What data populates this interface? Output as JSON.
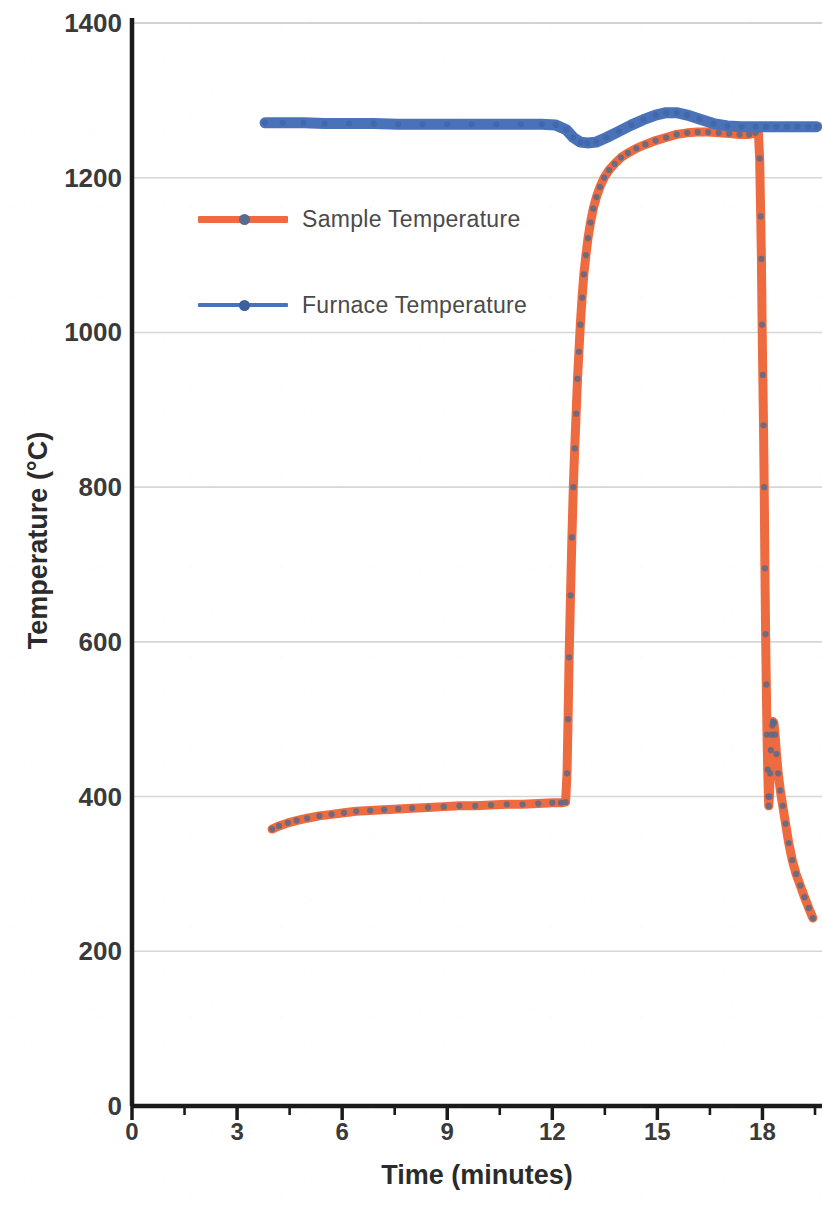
{
  "chart_data": {
    "type": "line",
    "title": "",
    "xlabel": "Time (minutes)",
    "ylabel": "Temperature (°C)",
    "xlim": [
      0,
      19.7
    ],
    "ylim": [
      0,
      1400
    ],
    "xticks": [
      0,
      3,
      6,
      9,
      12,
      15,
      18
    ],
    "xtick_labels": [
      "0",
      "3",
      "6",
      "9",
      "12",
      "15",
      "18"
    ],
    "x_minor_tick_interval": 1.5,
    "yticks": [
      0,
      200,
      400,
      600,
      800,
      1000,
      1200,
      1400
    ],
    "ytick_labels": [
      "0",
      "200",
      "400",
      "600",
      "800",
      "1000",
      "1200",
      "1400"
    ],
    "grid": "horizontal-only",
    "grid_color": "#c9c9c9",
    "legend_position": "upper-left-inside",
    "axis_color": "#1a1a1a",
    "series": [
      {
        "name": "Sample Temperature",
        "color": "#ED6B3F",
        "marker": "circle",
        "marker_color": "#5a6a8a",
        "x": [
          4.0,
          4.2,
          4.45,
          4.7,
          5.0,
          5.35,
          5.7,
          6.05,
          6.4,
          6.8,
          7.2,
          7.6,
          8.0,
          8.45,
          8.9,
          9.35,
          9.8,
          10.25,
          10.7,
          11.15,
          11.6,
          12.0,
          12.25,
          12.38,
          12.42,
          12.45,
          12.48,
          12.52,
          12.56,
          12.6,
          12.64,
          12.68,
          12.72,
          12.76,
          12.8,
          12.85,
          12.9,
          12.96,
          13.02,
          13.09,
          13.17,
          13.26,
          13.36,
          13.48,
          13.62,
          13.78,
          13.96,
          14.16,
          14.4,
          14.66,
          14.95,
          15.25,
          15.55,
          15.85,
          16.15,
          16.45,
          16.75,
          17.05,
          17.35,
          17.62,
          17.8,
          17.88,
          17.92,
          17.95,
          17.97,
          17.99,
          18.01,
          18.03,
          18.05,
          18.07,
          18.09,
          18.11,
          18.13,
          18.15,
          18.17,
          18.18,
          18.2,
          18.22,
          18.24,
          18.26,
          18.28,
          18.3,
          18.33,
          18.36,
          18.4,
          18.45,
          18.51,
          18.58,
          18.66,
          18.75,
          18.85,
          18.96,
          19.08,
          19.2,
          19.32,
          19.44
        ],
        "y": [
          358,
          362,
          366,
          369,
          372,
          375,
          377,
          379,
          381,
          382,
          383,
          384,
          385,
          386,
          387,
          388,
          388,
          389,
          390,
          390,
          391,
          392,
          392,
          393,
          430,
          500,
          580,
          660,
          735,
          800,
          850,
          895,
          940,
          975,
          1010,
          1045,
          1075,
          1100,
          1122,
          1142,
          1160,
          1175,
          1188,
          1200,
          1210,
          1218,
          1226,
          1232,
          1238,
          1243,
          1248,
          1252,
          1256,
          1258,
          1259,
          1259,
          1258,
          1257,
          1256,
          1256,
          1258,
          1262,
          1225,
          1150,
          1095,
          1010,
          945,
          880,
          800,
          695,
          610,
          545,
          480,
          435,
          400,
          388,
          400,
          430,
          460,
          480,
          492,
          497,
          495,
          480,
          455,
          430,
          408,
          388,
          365,
          340,
          318,
          300,
          285,
          270,
          256,
          243
        ]
      },
      {
        "name": "Furnace Temperature",
        "color": "#4A72B8",
        "marker": "circle",
        "marker_color": "#3d5f9e",
        "x": [
          3.8,
          4.3,
          4.9,
          5.5,
          6.2,
          6.9,
          7.6,
          8.3,
          9.0,
          9.7,
          10.4,
          11.1,
          11.7,
          12.1,
          12.4,
          12.6,
          12.8,
          13.0,
          13.25,
          13.55,
          13.9,
          14.25,
          14.6,
          14.95,
          15.25,
          15.55,
          15.85,
          16.2,
          16.6,
          17.0,
          17.4,
          17.8,
          18.1,
          18.4,
          18.7,
          19.0,
          19.3,
          19.55
        ],
        "y": [
          1271,
          1271,
          1271,
          1270,
          1270,
          1270,
          1269,
          1269,
          1269,
          1269,
          1269,
          1269,
          1269,
          1268,
          1262,
          1252,
          1246,
          1245,
          1246,
          1252,
          1260,
          1268,
          1275,
          1281,
          1284,
          1284,
          1281,
          1276,
          1270,
          1267,
          1266,
          1266,
          1266,
          1266,
          1266,
          1266,
          1266,
          1266
        ]
      }
    ]
  },
  "legend": {
    "items": [
      {
        "label": "Sample Temperature",
        "color": "#ED6B3F",
        "marker_color": "#5a6a8a",
        "thickness": "thick"
      },
      {
        "label": "Furnace Temperature",
        "color": "#4A72B8",
        "marker_color": "#3d5f9e",
        "thickness": "thin"
      }
    ]
  }
}
